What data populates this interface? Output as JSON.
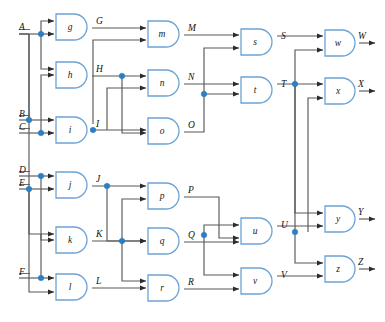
{
  "diagram": {
    "colors": {
      "wire": "#58595b",
      "gate_outline": "#6ba3d6",
      "gate_fill": "#ffffff",
      "junction": "#2b7fc4",
      "text": "#111111"
    },
    "inputs": [
      {
        "name": "A",
        "label": "A",
        "x": 22,
        "y": 34
      },
      {
        "name": "B",
        "label": "B",
        "x": 22,
        "y": 120
      },
      {
        "name": "C",
        "label": "C",
        "x": 22,
        "y": 133
      },
      {
        "name": "D",
        "label": "D",
        "x": 22,
        "y": 176
      },
      {
        "name": "E",
        "label": "E",
        "x": 22,
        "y": 189
      },
      {
        "name": "F",
        "label": "F",
        "x": 22,
        "y": 278
      }
    ],
    "outputs": [
      {
        "name": "W",
        "label": "W",
        "x": 358,
        "y": 43
      },
      {
        "name": "X",
        "label": "X",
        "x": 358,
        "y": 91
      },
      {
        "name": "Y",
        "label": "Y",
        "x": 358,
        "y": 219
      },
      {
        "name": "Z",
        "label": "Z",
        "x": 358,
        "y": 269
      }
    ],
    "gates": [
      {
        "name": "gate-g",
        "label": "g",
        "column": 1,
        "x": 56,
        "y": 14,
        "w": 36,
        "h": 26
      },
      {
        "name": "gate-h",
        "label": "h",
        "column": 1,
        "x": 56,
        "y": 62,
        "w": 36,
        "h": 26
      },
      {
        "name": "gate-i",
        "label": "i",
        "column": 1,
        "x": 56,
        "y": 117,
        "w": 36,
        "h": 26
      },
      {
        "name": "gate-j",
        "label": "j",
        "column": 1,
        "x": 56,
        "y": 172,
        "w": 36,
        "h": 26
      },
      {
        "name": "gate-k",
        "label": "k",
        "column": 1,
        "x": 56,
        "y": 227,
        "w": 36,
        "h": 26
      },
      {
        "name": "gate-l",
        "label": "l",
        "column": 1,
        "x": 56,
        "y": 274,
        "w": 36,
        "h": 26
      },
      {
        "name": "gate-m",
        "label": "m",
        "column": 2,
        "x": 148,
        "y": 21,
        "w": 36,
        "h": 26
      },
      {
        "name": "gate-n",
        "label": "n",
        "column": 2,
        "x": 148,
        "y": 70,
        "w": 36,
        "h": 26
      },
      {
        "name": "gate-o",
        "label": "o",
        "column": 2,
        "x": 148,
        "y": 118,
        "w": 36,
        "h": 26
      },
      {
        "name": "gate-p",
        "label": "p",
        "column": 2,
        "x": 148,
        "y": 183,
        "w": 36,
        "h": 26
      },
      {
        "name": "gate-q",
        "label": "q",
        "column": 2,
        "x": 148,
        "y": 228,
        "w": 36,
        "h": 26
      },
      {
        "name": "gate-r",
        "label": "r",
        "column": 2,
        "x": 148,
        "y": 275,
        "w": 36,
        "h": 26
      },
      {
        "name": "gate-s",
        "label": "s",
        "column": 3,
        "x": 241,
        "y": 29,
        "w": 36,
        "h": 26
      },
      {
        "name": "gate-t",
        "label": "t",
        "column": 3,
        "x": 241,
        "y": 77,
        "w": 36,
        "h": 26
      },
      {
        "name": "gate-u",
        "label": "u",
        "column": 3,
        "x": 241,
        "y": 218,
        "w": 36,
        "h": 26
      },
      {
        "name": "gate-v",
        "label": "v",
        "column": 3,
        "x": 241,
        "y": 268,
        "w": 36,
        "h": 26
      },
      {
        "name": "gate-w",
        "label": "w",
        "column": 4,
        "x": 325,
        "y": 30,
        "w": 34,
        "h": 26
      },
      {
        "name": "gate-x",
        "label": "x",
        "column": 4,
        "x": 325,
        "y": 78,
        "w": 34,
        "h": 26
      },
      {
        "name": "gate-y",
        "label": "y",
        "column": 4,
        "x": 325,
        "y": 206,
        "w": 34,
        "h": 26
      },
      {
        "name": "gate-z",
        "label": "z",
        "column": 4,
        "x": 325,
        "y": 256,
        "w": 34,
        "h": 26
      }
    ],
    "intermediate_labels": [
      {
        "name": "signal-G",
        "label": "G",
        "x": 97,
        "y": 21
      },
      {
        "name": "signal-H",
        "label": "H",
        "x": 97,
        "y": 69
      },
      {
        "name": "signal-I",
        "label": "I",
        "x": 97,
        "y": 124
      },
      {
        "name": "signal-J",
        "label": "J",
        "x": 97,
        "y": 179
      },
      {
        "name": "signal-K",
        "label": "K",
        "x": 97,
        "y": 234
      },
      {
        "name": "signal-L",
        "label": "L",
        "x": 97,
        "y": 281
      },
      {
        "name": "signal-M",
        "label": "M",
        "x": 189,
        "y": 28
      },
      {
        "name": "signal-N",
        "label": "N",
        "x": 189,
        "y": 77
      },
      {
        "name": "signal-O",
        "label": "O",
        "x": 189,
        "y": 125
      },
      {
        "name": "signal-P",
        "label": "P",
        "x": 189,
        "y": 190
      },
      {
        "name": "signal-Q",
        "label": "Q",
        "x": 189,
        "y": 235
      },
      {
        "name": "signal-R",
        "label": "R",
        "x": 189,
        "y": 282
      },
      {
        "name": "signal-S",
        "label": "S",
        "x": 282,
        "y": 36
      },
      {
        "name": "signal-T",
        "label": "T",
        "x": 282,
        "y": 84
      },
      {
        "name": "signal-U",
        "label": "U",
        "x": 282,
        "y": 225
      },
      {
        "name": "signal-V",
        "label": "V",
        "x": 282,
        "y": 275
      }
    ],
    "junctions": [
      {
        "name": "junction-A-branch",
        "x": 41,
        "y": 34
      },
      {
        "name": "junction-B-branch",
        "x": 29,
        "y": 120
      },
      {
        "name": "junction-C-branch",
        "x": 41,
        "y": 133
      },
      {
        "name": "junction-D-branch",
        "x": 41,
        "y": 176
      },
      {
        "name": "junction-E-branch",
        "x": 29,
        "y": 189
      },
      {
        "name": "junction-F-branch",
        "x": 41,
        "y": 278
      },
      {
        "name": "junction-H-branch",
        "x": 122,
        "y": 69
      },
      {
        "name": "junction-I-branch",
        "x": 93,
        "y": 124
      },
      {
        "name": "junction-J-branch",
        "x": 107,
        "y": 179
      },
      {
        "name": "junction-K-branch",
        "x": 122,
        "y": 234
      },
      {
        "name": "junction-N-branch",
        "x": 204,
        "y": 94
      },
      {
        "name": "junction-Q-branch",
        "x": 204,
        "y": 235
      },
      {
        "name": "junction-T-branch",
        "x": 295,
        "y": 84
      },
      {
        "name": "junction-U-branch",
        "x": 295,
        "y": 232
      }
    ]
  }
}
